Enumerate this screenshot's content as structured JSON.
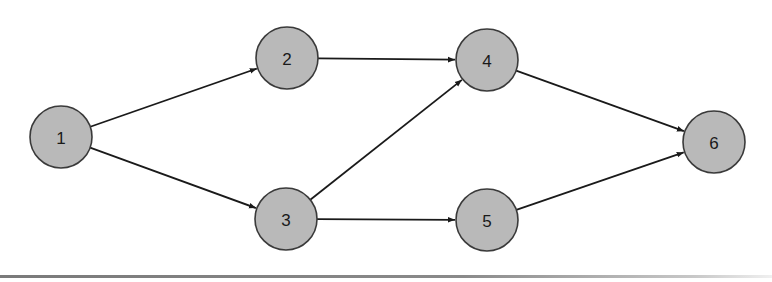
{
  "diagram": {
    "type": "directed-network-graph",
    "nodes": [
      {
        "id": "1",
        "label": "1",
        "x": 61,
        "y": 137,
        "r": 31
      },
      {
        "id": "2",
        "label": "2",
        "x": 287,
        "y": 58,
        "r": 31
      },
      {
        "id": "3",
        "label": "3",
        "x": 286,
        "y": 219,
        "r": 31
      },
      {
        "id": "4",
        "label": "4",
        "x": 487,
        "y": 60,
        "r": 31
      },
      {
        "id": "5",
        "label": "5",
        "x": 487,
        "y": 220,
        "r": 31
      },
      {
        "id": "6",
        "label": "6",
        "x": 714,
        "y": 142,
        "r": 31
      }
    ],
    "edges": [
      {
        "from": "1",
        "to": "2"
      },
      {
        "from": "1",
        "to": "3"
      },
      {
        "from": "2",
        "to": "4"
      },
      {
        "from": "3",
        "to": "4"
      },
      {
        "from": "3",
        "to": "5"
      },
      {
        "from": "4",
        "to": "6"
      },
      {
        "from": "5",
        "to": "6"
      }
    ],
    "colors": {
      "node_fill": "#b9b9b9",
      "node_stroke": "#3a3a3a",
      "edge": "#1a1a1a",
      "baseline": "#7a7a7a"
    }
  }
}
